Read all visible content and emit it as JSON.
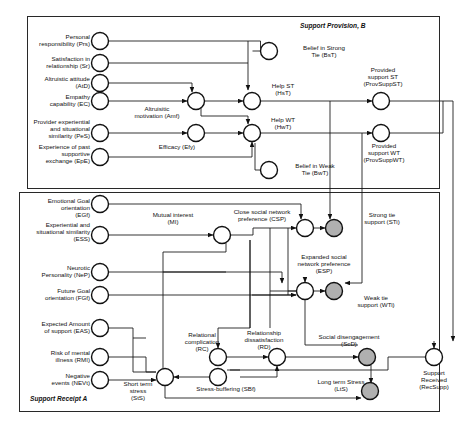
{
  "diagram": {
    "type": "causal-loop-diagram",
    "boxes": [
      {
        "id": "B",
        "label": "Support Provision, B",
        "x": 27,
        "y": 16,
        "w": 412,
        "h": 172
      },
      {
        "id": "A",
        "label": "Support Receipt A",
        "x": 19,
        "y": 192,
        "w": 420,
        "h": 219
      }
    ],
    "nodes": [
      {
        "id": "Prs",
        "label": "Personal\nresponsibility (Prs)",
        "cx": 100,
        "cy": 41,
        "r": 8.5,
        "fill": "white",
        "lx": 6,
        "ly": 33,
        "lw": 84,
        "align": "left"
      },
      {
        "id": "Sr",
        "label": "Satisfaction in\nrelationship (Sr)",
        "cx": 100,
        "cy": 63,
        "r": 8.5,
        "fill": "white",
        "lx": 6,
        "ly": 55,
        "lw": 84,
        "align": "left"
      },
      {
        "id": "AtD",
        "label": "Altruistic attitude\n(AtD)",
        "cx": 100,
        "cy": 83,
        "r": 8.5,
        "fill": "white",
        "lx": 6,
        "ly": 75,
        "lw": 84,
        "align": "left"
      },
      {
        "id": "EC",
        "label": "Empathy\ncapability (EC)",
        "cx": 100,
        "cy": 101,
        "r": 8.5,
        "fill": "white",
        "lx": 6,
        "ly": 93,
        "lw": 84,
        "align": "left"
      },
      {
        "id": "PeS",
        "label": "Provider experiential\nand situational\nsimilarity (PeS)",
        "cx": 100,
        "cy": 133,
        "r": 8.5,
        "fill": "white",
        "lx": 2,
        "ly": 118,
        "lw": 88,
        "align": "left"
      },
      {
        "id": "EpE",
        "label": "Experience of past\nsupportive\nexchange (EpE)",
        "cx": 100,
        "cy": 157,
        "r": 8.5,
        "fill": "white",
        "lx": 2,
        "ly": 143,
        "lw": 88,
        "align": "left"
      },
      {
        "id": "Amf",
        "label": "Altruisitic\nmotivation (Amf)",
        "cx": 196,
        "cy": 101,
        "r": 8.5,
        "fill": "white",
        "lx": 120,
        "ly": 105,
        "lw": 74,
        "align": "center"
      },
      {
        "id": "Efy",
        "label": "Efficacy (Efy)",
        "cx": 196,
        "cy": 133,
        "r": 8.5,
        "fill": "white",
        "lx": 146,
        "ly": 143,
        "lw": 62,
        "align": "center"
      },
      {
        "id": "BsT",
        "label": "Belief in Strong\nTie (BsT)",
        "cx": 269,
        "cy": 51,
        "r": 8.5,
        "fill": "white",
        "lx": 286,
        "ly": 44,
        "lw": 76,
        "align": "center"
      },
      {
        "id": "HsT",
        "label": "Help ST\n(HsT)",
        "cx": 252,
        "cy": 101,
        "r": 8.5,
        "fill": "white",
        "lx": 258,
        "ly": 82,
        "lw": 50,
        "align": "center"
      },
      {
        "id": "HwT",
        "label": "Help WT\n(HwT)",
        "cx": 252,
        "cy": 133,
        "r": 8.5,
        "fill": "white",
        "lx": 258,
        "ly": 116,
        "lw": 50,
        "align": "center"
      },
      {
        "id": "BwT",
        "label": "Belief in Weak\nTie (BwT)",
        "cx": 269,
        "cy": 170,
        "r": 8.5,
        "fill": "white",
        "lx": 280,
        "ly": 162,
        "lw": 70,
        "align": "center"
      },
      {
        "id": "ProvSuppST",
        "label": "Provided\nsupport ST\n(ProvSuppST)",
        "cx": 381,
        "cy": 101,
        "r": 8.5,
        "fill": "white",
        "lx": 343,
        "ly": 66,
        "lw": 80,
        "align": "center"
      },
      {
        "id": "ProvSuppWT",
        "label": "Provided\nsupport WT\n(ProvSuppWT)",
        "cx": 381,
        "cy": 133,
        "r": 8.5,
        "fill": "white",
        "lx": 343,
        "ly": 142,
        "lw": 82,
        "align": "center"
      },
      {
        "id": "EGf",
        "label": "Emotional Goal\norientation\n(EGf)",
        "cx": 100,
        "cy": 204,
        "r": 8.5,
        "fill": "white",
        "lx": 6,
        "ly": 197,
        "lw": 84,
        "align": "left"
      },
      {
        "id": "ESS",
        "label": "Experiential and\nsituational similarity\n(ESS)",
        "cx": 100,
        "cy": 235,
        "r": 8.5,
        "fill": "white",
        "lx": 0,
        "ly": 221,
        "lw": 90,
        "align": "left"
      },
      {
        "id": "NeP",
        "label": "Neurotic\nPersonality (NeP)",
        "cx": 100,
        "cy": 272,
        "r": 8.5,
        "fill": "white",
        "lx": 6,
        "ly": 264,
        "lw": 84,
        "align": "left"
      },
      {
        "id": "FGf",
        "label": "Future Goal\norientation (FGf)",
        "cx": 100,
        "cy": 295,
        "r": 8.5,
        "fill": "white",
        "lx": 6,
        "ly": 287,
        "lw": 84,
        "align": "left"
      },
      {
        "id": "EAS",
        "label": "Expected Amount\nof support (EAS)",
        "cx": 100,
        "cy": 328,
        "r": 8.5,
        "fill": "white",
        "lx": 4,
        "ly": 320,
        "lw": 86,
        "align": "left"
      },
      {
        "id": "RMI",
        "label": "Risk of mental\nillness (RMI)",
        "cx": 100,
        "cy": 357,
        "r": 8.5,
        "fill": "white",
        "lx": 6,
        "ly": 349,
        "lw": 84,
        "align": "left"
      },
      {
        "id": "NEVt",
        "label": "Negative\nevents (NEVt)",
        "cx": 100,
        "cy": 380,
        "r": 8.5,
        "fill": "white",
        "lx": 6,
        "ly": 372,
        "lw": 84,
        "align": "left"
      },
      {
        "id": "MI",
        "label": "Mutual interest\n(MI)",
        "cx": 222,
        "cy": 235,
        "r": 8.5,
        "fill": "white",
        "lx": 138,
        "ly": 211,
        "lw": 70,
        "align": "center"
      },
      {
        "id": "CSP",
        "label": "Close social network\npreference (CSP)",
        "cx": 305,
        "cy": 228,
        "r": 8.5,
        "fill": "white",
        "lx": 216,
        "ly": 208,
        "lw": 92,
        "align": "center"
      },
      {
        "id": "STi",
        "label": "Strong tie\nsupport (STi)",
        "cx": 334,
        "cy": 228,
        "r": 8.5,
        "fill": "gray",
        "lx": 352,
        "ly": 211,
        "lw": 60,
        "align": "center"
      },
      {
        "id": "ESP",
        "label": "Expanded social\nnetwork preference\n(ESP)",
        "cx": 305,
        "cy": 291,
        "r": 8.5,
        "fill": "white",
        "lx": 282,
        "ly": 253,
        "lw": 84,
        "align": "center"
      },
      {
        "id": "WTi",
        "label": "Weak tie\nsupport (WTi)",
        "cx": 334,
        "cy": 291,
        "r": 8.5,
        "fill": "gray",
        "lx": 346,
        "ly": 294,
        "lw": 60,
        "align": "center"
      },
      {
        "id": "RC",
        "label": "Relational\ncomplication\n(RC)",
        "cx": 218,
        "cy": 357,
        "r": 8.5,
        "fill": "white",
        "lx": 172,
        "ly": 331,
        "lw": 60,
        "align": "center"
      },
      {
        "id": "RD",
        "label": "Relationship\ndissatisfaction\n(RD)",
        "cx": 277,
        "cy": 357,
        "r": 8.5,
        "fill": "white",
        "lx": 226,
        "ly": 329,
        "lw": 76,
        "align": "center"
      },
      {
        "id": "ScD",
        "label": "Social disengagement\n(ScD)",
        "cx": 367,
        "cy": 357,
        "r": 8.5,
        "fill": "gray",
        "lx": 300,
        "ly": 333,
        "lw": 98,
        "align": "center"
      },
      {
        "id": "SBf",
        "label": "Stress-buffering (SBf)",
        "cx": 218,
        "cy": 377,
        "r": 8.5,
        "fill": "white",
        "lx": 182,
        "ly": 385,
        "lw": 88,
        "align": "center"
      },
      {
        "id": "StS",
        "label": "Short term\nstress\n(StS)",
        "cx": 165,
        "cy": 377,
        "r": 8.5,
        "fill": "white",
        "lx": 113,
        "ly": 380,
        "lw": 50,
        "align": "center"
      },
      {
        "id": "LtS",
        "label": "Long term Stress\n(LtS)",
        "cx": 370,
        "cy": 391,
        "r": 8.5,
        "fill": "gray",
        "lx": 305,
        "ly": 378,
        "lw": 72,
        "align": "center"
      },
      {
        "id": "RecSupp",
        "label": "Support\nReceived\n(RecSupp)",
        "cx": 434,
        "cy": 357,
        "r": 8.5,
        "fill": "white",
        "lx": 400,
        "ly": 369,
        "lw": 68,
        "align": "center"
      }
    ],
    "legend": {
      "gray_fill": "#b0b0b0",
      "stroke": "#111111",
      "background": "#ffffff"
    },
    "edges": [
      "Prs -> HsT",
      "Sr -> HsT",
      "AtD -> Amf",
      "EC -> Amf",
      "Amf -> HsT",
      "Amf -> HwT",
      "PeS -> Efy",
      "Efy -> HwT",
      "EpE -> HwT",
      "BsT -> HsT",
      "BwT -> HwT",
      "HsT -> ProvSuppST",
      "HwT -> ProvSuppWT",
      "ProvSuppST -> STi",
      "ProvSuppWT -> WTi",
      "ProvSuppST -> RecSupp",
      "ProvSuppWT -> RecSupp",
      "EGf -> CSP",
      "ESS -> MI",
      "MI -> CSP",
      "MI -> ESP",
      "NeP -> ESP",
      "FGf -> ESP",
      "EAS -> StS",
      "RMI -> StS",
      "NEVt -> StS",
      "CSP -> STi",
      "ESP -> WTi",
      "RC -> RD",
      "RD -> ScD",
      "SBf -> StS",
      "StS -> LtS",
      "ScD -> LtS",
      "RecSupp -> SBf",
      "LtS -> RC"
    ]
  }
}
